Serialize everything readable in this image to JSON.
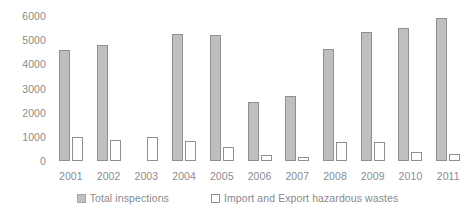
{
  "chart_data": {
    "type": "bar",
    "title": "",
    "xlabel": "",
    "ylabel": "",
    "ylim": [
      0,
      6000
    ],
    "yticks": [
      0,
      1000,
      2000,
      3000,
      4000,
      5000,
      6000
    ],
    "ytick_labels": [
      "0",
      "1000",
      "2000",
      "3000",
      "4000",
      "5000",
      "6000"
    ],
    "grid": false,
    "legend_position": "bottom",
    "categories": [
      "2001",
      "2002",
      "2003",
      "2004",
      "2005",
      "2006",
      "2007",
      "2008",
      "2009",
      "2010",
      "2011"
    ],
    "series": [
      {
        "name": "Total inspections",
        "color": "#bfbfbf",
        "border_color": "#8f8f8f",
        "values": [
          4600,
          4800,
          null,
          5250,
          5200,
          2450,
          2700,
          4650,
          5350,
          5500,
          5900
        ]
      },
      {
        "name": "Import and Export hazardous wastes",
        "color": "#ffffff",
        "border_color": "#8f8f8f",
        "values": [
          1000,
          880,
          1000,
          830,
          600,
          250,
          180,
          800,
          800,
          380,
          300
        ]
      }
    ]
  },
  "legend": {
    "items": [
      {
        "label": "Total inspections",
        "swatch": "filled-gray-swatch"
      },
      {
        "label": "Import and Export hazardous wastes",
        "swatch": "outlined-white-swatch"
      }
    ]
  }
}
